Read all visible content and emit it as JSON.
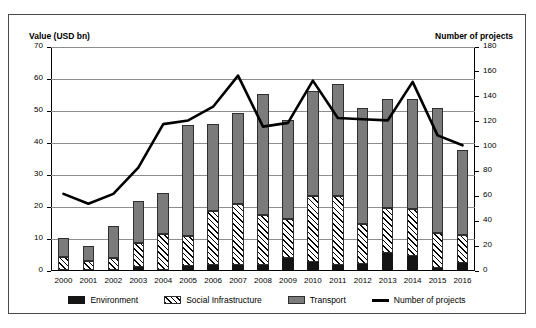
{
  "chart_data": {
    "type": "bar",
    "title": "",
    "subtitle": "",
    "xlabel": "",
    "ylabel": "Value (USD bn)",
    "y2label": "Number of projects",
    "ylim": [
      0,
      70
    ],
    "y2lim": [
      0,
      180
    ],
    "yticks": [
      "0",
      "10",
      "20",
      "30",
      "40",
      "50",
      "60",
      "70"
    ],
    "y2ticks": [
      "0",
      "20",
      "40",
      "60",
      "80",
      "100",
      "120",
      "140",
      "160",
      "180"
    ],
    "grid": true,
    "legend_position": "bottom",
    "categories": [
      "2000",
      "2001",
      "2002",
      "2003",
      "2004",
      "2005",
      "2006",
      "2007",
      "2008",
      "2009",
      "2010",
      "2011",
      "2012",
      "2013",
      "2014",
      "2015",
      "2016"
    ],
    "series": [
      {
        "name": "Environment",
        "axis": "left",
        "color": "#141414",
        "values": [
          0.0,
          0.0,
          0.0,
          0.8,
          0.0,
          1.3,
          1.6,
          1.6,
          1.6,
          3.7,
          2.5,
          1.6,
          1.8,
          5.2,
          4.3,
          0.5,
          2.3
        ]
      },
      {
        "name": "Social Infrastructure",
        "axis": "left",
        "color": "#ffffff",
        "pattern": "diagonal-hatch",
        "values": [
          4.2,
          2.8,
          3.6,
          7.7,
          11.3,
          9.3,
          16.7,
          19.1,
          15.5,
          12.3,
          20.5,
          21.4,
          12.7,
          14.3,
          14.7,
          11.0,
          8.7
        ]
      },
      {
        "name": "Transport",
        "axis": "left",
        "color": "#7b7b7b",
        "values": [
          5.9,
          4.6,
          10.2,
          13.2,
          12.7,
          34.7,
          27.2,
          28.3,
          38.0,
          31.0,
          33.0,
          35.0,
          36.0,
          34.0,
          34.5,
          39.0,
          26.5
        ]
      },
      {
        "name": "Number of projects",
        "axis": "right",
        "color": "#000000",
        "type": "line",
        "values": [
          62,
          54,
          62,
          83,
          118,
          121,
          132,
          157,
          116,
          119,
          153,
          123,
          122,
          121,
          152,
          109,
          101
        ]
      }
    ],
    "stacked_totals": [
      10.1,
      7.4,
      13.8,
      21.7,
      24.0,
      45.3,
      45.5,
      49.0,
      55.1,
      47.0,
      56.0,
      58.0,
      50.5,
      53.5,
      53.5,
      50.5,
      37.5
    ],
    "legend": [
      "Environment",
      "Social Infrastructure",
      "Transport",
      "Number of projects"
    ]
  }
}
